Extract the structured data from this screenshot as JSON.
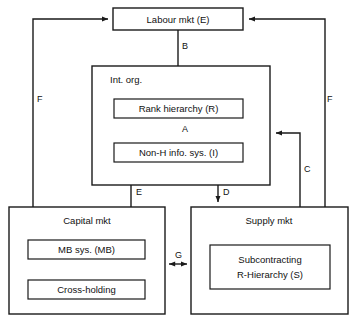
{
  "diagram": {
    "type": "block-diagram",
    "canvas": {
      "width": 358,
      "height": 326
    },
    "colors": {
      "background": "#ffffff",
      "stroke": "#1a1a1a",
      "text": "#111111"
    },
    "nodes": {
      "labour_mkt": {
        "label": "Labour mkt (E)",
        "x": 113,
        "y": 8,
        "w": 130,
        "h": 22
      },
      "int_org": {
        "label": "Int. org.",
        "x": 92,
        "y": 66,
        "w": 178,
        "h": 119
      },
      "rank_hierarchy": {
        "label": "Rank hierarchy (R)",
        "x": 114,
        "y": 99,
        "w": 129,
        "h": 19
      },
      "non_h_info_sys": {
        "label": "Non-H info. sys. (I)",
        "x": 114,
        "y": 143,
        "w": 129,
        "h": 19
      },
      "capital_mkt": {
        "label": "Capital mkt",
        "x": 9,
        "y": 207,
        "w": 156,
        "h": 107
      },
      "mb_sys": {
        "label": "MB sys. (MB)",
        "x": 28,
        "y": 240,
        "w": 117,
        "h": 19
      },
      "cross_holding": {
        "label": "Cross-holding",
        "x": 28,
        "y": 280,
        "w": 117,
        "h": 19
      },
      "supply_mkt": {
        "label": "Supply mkt",
        "x": 191,
        "y": 207,
        "w": 157,
        "h": 107
      },
      "subcontracting": {
        "label_line1": "Subcontracting",
        "label_line2": "R-Hierarchy (S)",
        "x": 210,
        "y": 245,
        "w": 120,
        "h": 44
      }
    },
    "edges": [
      {
        "id": "A",
        "label": "A",
        "from": "rank_hierarchy",
        "to": "non_h_info_sys",
        "arrows": "both",
        "label_x": 182,
        "label_y": 130
      },
      {
        "id": "B",
        "label": "B",
        "from": "labour_mkt",
        "to": "rank_hierarchy",
        "arrows": "end",
        "label_x": 182,
        "label_y": 47
      },
      {
        "id": "C",
        "label": "C",
        "from": "supply_mkt",
        "to": "int_org",
        "arrows": "end",
        "label_x": 304,
        "label_y": 170
      },
      {
        "id": "D",
        "label": "D",
        "from": "non_h_info_sys",
        "to": "supply_mkt",
        "arrows": "end",
        "label_x": 223,
        "label_y": 193
      },
      {
        "id": "E",
        "label": "E",
        "from": "mb_sys",
        "to": "non_h_info_sys",
        "arrows": "end",
        "label_x": 136,
        "label_y": 193
      },
      {
        "id": "F_left",
        "label": "F",
        "from": "capital_mkt",
        "to": "labour_mkt",
        "arrows": "end",
        "label_x": 37,
        "label_y": 100
      },
      {
        "id": "F_right",
        "label": "F",
        "from": "supply_mkt",
        "to": "labour_mkt",
        "arrows": "end",
        "label_x": 327,
        "label_y": 100
      },
      {
        "id": "G",
        "label": "G",
        "from": "capital_mkt",
        "to": "supply_mkt",
        "arrows": "both",
        "label_x": 175,
        "label_y": 256
      },
      {
        "id": "MB_CH",
        "label": "",
        "from": "mb_sys",
        "to": "cross_holding",
        "arrows": "both",
        "label_x": 0,
        "label_y": 0
      }
    ]
  }
}
